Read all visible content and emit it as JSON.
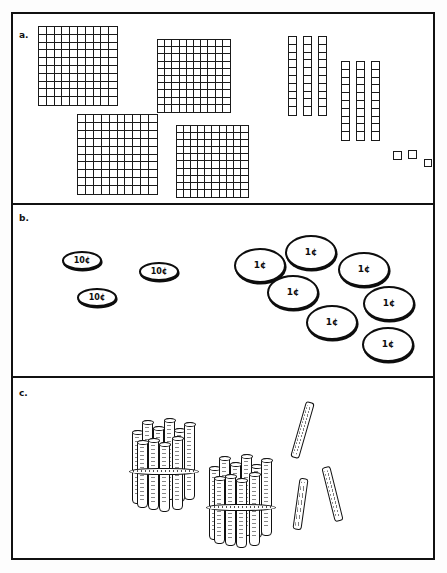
{
  "figure": {
    "border_color": "#111111",
    "background_color": "#ffffff"
  },
  "panels": [
    {
      "id": "a",
      "label": "a.",
      "representation": "base-ten-blocks",
      "hundreds_flats": 4,
      "tens_rods": 6,
      "ones_cubes": 3,
      "flat_grid": {
        "rows": 10,
        "columns": 10
      },
      "rod_segments": 10,
      "rod_groups": [
        3,
        3
      ],
      "total_value": 463
    },
    {
      "id": "b",
      "label": "b.",
      "representation": "coins",
      "dime_label": "10¢",
      "penny_label": "1¢",
      "dimes": 3,
      "pennies": 7,
      "total_value_cents": 37
    },
    {
      "id": "c",
      "label": "c.",
      "representation": "bundled-sticks",
      "bundles_of_ten": 2,
      "loose_sticks": 3,
      "sticks_per_bundle": 10,
      "total_value": 23
    }
  ],
  "coins": {
    "dimes": [
      {
        "label": "10¢",
        "x": 62,
        "y": 251
      },
      {
        "label": "10¢",
        "x": 139,
        "y": 262
      },
      {
        "label": "10¢",
        "x": 77,
        "y": 288
      }
    ],
    "pennies": [
      {
        "label": "1¢",
        "x": 234,
        "y": 248
      },
      {
        "label": "1¢",
        "x": 285,
        "y": 235
      },
      {
        "label": "1¢",
        "x": 338,
        "y": 252
      },
      {
        "label": "1¢",
        "x": 267,
        "y": 275
      },
      {
        "label": "1¢",
        "x": 363,
        "y": 286
      },
      {
        "label": "1¢",
        "x": 306,
        "y": 305
      },
      {
        "label": "1¢",
        "x": 362,
        "y": 327
      }
    ]
  },
  "blocks": {
    "flats": [
      {
        "x": 38,
        "y": 26,
        "size": 80
      },
      {
        "x": 157,
        "y": 39,
        "size": 74
      },
      {
        "x": 77,
        "y": 114,
        "size": 81
      },
      {
        "x": 176,
        "y": 125,
        "size": 73
      }
    ],
    "rods": [
      {
        "x": 288,
        "y": 36,
        "width": 9,
        "height": 80
      },
      {
        "x": 303,
        "y": 36,
        "width": 9,
        "height": 80
      },
      {
        "x": 318,
        "y": 36,
        "width": 9,
        "height": 80
      },
      {
        "x": 341,
        "y": 61,
        "width": 9,
        "height": 80
      },
      {
        "x": 356,
        "y": 61,
        "width": 9,
        "height": 80
      },
      {
        "x": 371,
        "y": 61,
        "width": 9,
        "height": 80
      }
    ],
    "cubes": [
      {
        "x": 393,
        "y": 151,
        "size": 9
      },
      {
        "x": 408,
        "y": 150,
        "size": 9
      },
      {
        "x": 424,
        "y": 159,
        "size": 8
      }
    ]
  },
  "sticks": {
    "bundles": [
      {
        "x": 128,
        "y": 416,
        "width": 72,
        "height": 96
      },
      {
        "x": 205,
        "y": 452,
        "width": 72,
        "height": 96
      }
    ],
    "loose": [
      {
        "x": 298,
        "y": 401,
        "width": 9,
        "height": 58,
        "rotate": 16
      },
      {
        "x": 296,
        "y": 478,
        "width": 9,
        "height": 52,
        "rotate": 8
      },
      {
        "x": 328,
        "y": 466,
        "width": 9,
        "height": 56,
        "rotate": -14
      }
    ]
  }
}
